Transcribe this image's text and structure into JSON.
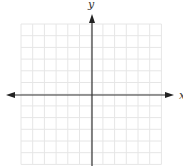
{
  "diagram": {
    "type": "coordinate-plane",
    "x_axis_label": "x",
    "y_axis_label": "y",
    "grid": {
      "columns": 12,
      "rows": 12,
      "left": 21,
      "top": 24,
      "cell": 11.7,
      "line_color": "#e6e6e6"
    },
    "axes": {
      "origin_x": 92,
      "origin_y": 95,
      "color": "#333333",
      "arrow_left_x": 6,
      "arrow_right_x": 174,
      "arrow_up_y": 14
    }
  }
}
